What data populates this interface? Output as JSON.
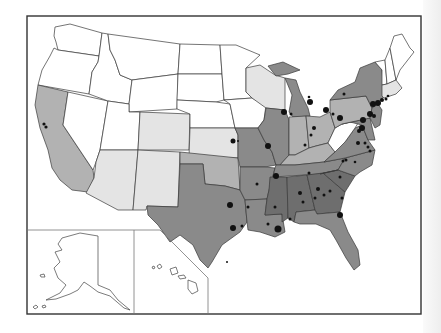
{
  "map": {
    "type": "choropleth",
    "region": "United States",
    "legend": null,
    "shade_colors": {
      "none": "#ffffff",
      "light": "#e4e4e4",
      "medium": "#b2b2b2",
      "dark": "#8a8a8a",
      "darkest": "#6e6e6e"
    },
    "states": {
      "WA": "none",
      "OR": "none",
      "ID": "none",
      "MT": "none",
      "WY": "none",
      "NV": "none",
      "UT": "none",
      "ND": "none",
      "SD": "none",
      "NE": "none",
      "MN": "none",
      "IA": "none",
      "ME": "none",
      "NH": "none",
      "VT": "none",
      "WV": "none",
      "CA": "medium",
      "PA": "medium",
      "IN": "medium",
      "OH": "medium",
      "KY": "medium",
      "CO": "light",
      "KS": "light",
      "AZ": "light",
      "NM": "light",
      "WI": "light",
      "MA": "light",
      "CT": "light",
      "RI": "light",
      "OK": "medium",
      "TX": "dark",
      "LA": "dark",
      "AR": "dark",
      "MO": "dark",
      "IL": "dark",
      "MI": "dark",
      "NY": "dark",
      "VA": "dark",
      "NC": "dark",
      "TN": "dark",
      "FL": "dark",
      "MD": "dark",
      "NJ": "dark",
      "DE": "dark",
      "MS": "darkest",
      "AL": "darkest",
      "GA": "darkest",
      "SC": "darkest"
    },
    "insets": [
      "Alaska",
      "Hawaii"
    ],
    "city_markers": "black dots of varying size marking cities"
  }
}
